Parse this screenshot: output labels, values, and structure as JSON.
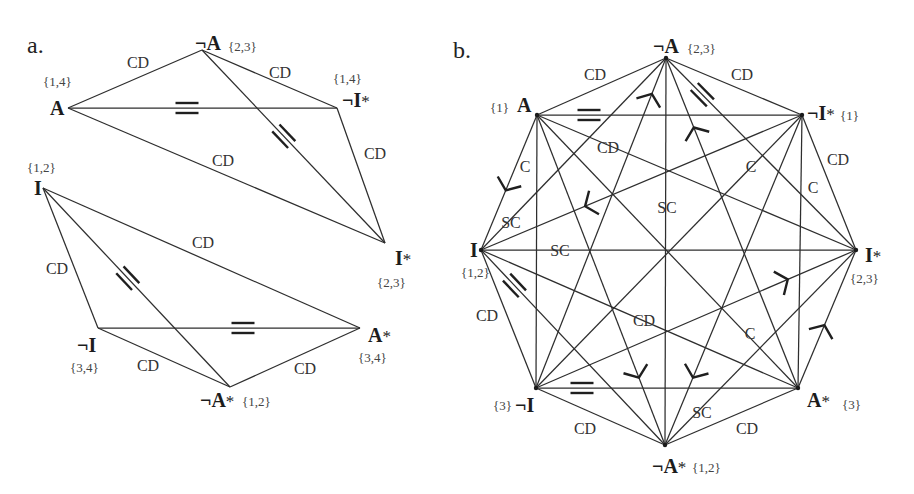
{
  "figure": {
    "colors": {
      "line": "#2e2e2e",
      "text": "#333333",
      "background": "#ffffff"
    },
    "panels": [
      {
        "key": "a",
        "label": "a.",
        "label_xy": [
          27,
          53
        ],
        "vertex_dots": false,
        "vertices": [
          {
            "id": "A",
            "label": "A",
            "star": "",
            "set": "{1,4}",
            "xy": [
              68,
              108
            ],
            "label_xy": [
              50,
              115
            ],
            "set_xy": [
              43,
              86
            ]
          },
          {
            "id": "notA",
            "label": "¬A",
            "star": "",
            "set": "{2,3}",
            "xy": [
              202,
              50
            ],
            "label_xy": [
              195,
              50
            ],
            "set_xy": [
              228,
              51
            ]
          },
          {
            "id": "notIstar",
            "label": "¬I",
            "star": "*",
            "set": "{1,4}",
            "xy": [
              337,
              108
            ],
            "label_xy": [
              342,
              107
            ],
            "set_xy": [
              333,
              83
            ]
          },
          {
            "id": "Istar",
            "label": "I",
            "star": "*",
            "set": "{2,3}",
            "xy": [
              385,
              243
            ],
            "label_xy": [
              395,
              265
            ],
            "set_xy": [
              377,
              287
            ]
          },
          {
            "id": "I",
            "label": "I",
            "star": "",
            "set": "{1,2}",
            "xy": [
              43,
              188
            ],
            "label_xy": [
              34,
              195
            ],
            "set_xy": [
              27,
              172
            ]
          },
          {
            "id": "notI",
            "label": "¬I",
            "star": "",
            "set": "{3,4}",
            "xy": [
              98,
              328
            ],
            "label_xy": [
              77,
              352
            ],
            "set_xy": [
              70,
              372
            ]
          },
          {
            "id": "notAstar",
            "label": "¬A",
            "star": "*",
            "set": "{1,2}",
            "xy": [
              230,
              387
            ],
            "label_xy": [
              200,
              407
            ],
            "set_xy": [
              242,
              406
            ]
          },
          {
            "id": "Astar",
            "label": "A",
            "star": "*",
            "set": "{3,4}",
            "xy": [
              360,
              328
            ],
            "label_xy": [
              368,
              342
            ],
            "set_xy": [
              358,
              362
            ]
          }
        ],
        "edges": [
          {
            "from": "A",
            "to": "notA",
            "marks": [
              {
                "type": "text",
                "text": "CD",
                "xy": [
                  138,
                  62
                ]
              }
            ]
          },
          {
            "from": "notA",
            "to": "notIstar",
            "marks": [
              {
                "type": "text",
                "text": "CD",
                "xy": [
                  280,
                  72
                ]
              }
            ]
          },
          {
            "from": "A",
            "to": "notIstar",
            "marks": [
              {
                "type": "equal",
                "xy": [
                  187,
                  107
                ]
              }
            ]
          },
          {
            "from": "notA",
            "to": "Istar",
            "marks": [
              {
                "type": "equal",
                "xy": [
                  283,
                  137
                ]
              }
            ]
          },
          {
            "from": "A",
            "to": "Istar",
            "marks": [
              {
                "type": "text",
                "text": "CD",
                "xy": [
                  223,
                  160
                ]
              }
            ]
          },
          {
            "from": "notIstar",
            "to": "Istar",
            "marks": [
              {
                "type": "text",
                "text": "CD",
                "xy": [
                  375,
                  153
                ]
              }
            ]
          },
          {
            "from": "I",
            "to": "notI",
            "marks": [
              {
                "type": "text",
                "text": "CD",
                "xy": [
                  57,
                  268
                ]
              }
            ]
          },
          {
            "from": "I",
            "to": "notAstar",
            "marks": [
              {
                "type": "equal",
                "xy": [
                  128,
                  278
                ]
              }
            ]
          },
          {
            "from": "I",
            "to": "Astar",
            "marks": [
              {
                "type": "text",
                "text": "CD",
                "xy": [
                  203,
                  242
                ]
              }
            ]
          },
          {
            "from": "notI",
            "to": "Astar",
            "marks": [
              {
                "type": "equal",
                "xy": [
                  243,
                  328
                ]
              }
            ]
          },
          {
            "from": "notI",
            "to": "notAstar",
            "marks": [
              {
                "type": "text",
                "text": "CD",
                "xy": [
                  148,
                  365
                ]
              }
            ]
          },
          {
            "from": "notAstar",
            "to": "Astar",
            "marks": [
              {
                "type": "text",
                "text": "CD",
                "xy": [
                  305,
                  368
                ]
              }
            ]
          }
        ]
      },
      {
        "key": "b",
        "label": "b.",
        "label_xy": [
          453,
          58
        ],
        "vertex_dots": true,
        "vertices": [
          {
            "id": "notA",
            "label": "¬A",
            "star": "",
            "set": "{2,3}",
            "xy": [
              666,
              58
            ],
            "label_xy": [
              653,
              53
            ],
            "set_xy": [
              687,
              53
            ]
          },
          {
            "id": "notIstar",
            "label": "¬I",
            "star": "*",
            "set": "{1}",
            "xy": [
              802,
              115
            ],
            "label_xy": [
              807,
              120
            ],
            "set_xy": [
              840,
              120
            ]
          },
          {
            "id": "Istar",
            "label": "I",
            "star": "*",
            "set": "{2,3}",
            "xy": [
              856,
              250
            ],
            "label_xy": [
              865,
              262
            ],
            "set_xy": [
              850,
              283
            ]
          },
          {
            "id": "Astar",
            "label": "A",
            "star": "*",
            "set": "{3}",
            "xy": [
              798,
              388
            ],
            "label_xy": [
              807,
              407
            ],
            "set_xy": [
              842,
              409
            ]
          },
          {
            "id": "notAstar",
            "label": "¬A",
            "star": "*",
            "set": "{1,2}",
            "xy": [
              665,
              445
            ],
            "label_xy": [
              652,
              473
            ],
            "set_xy": [
              692,
              472
            ]
          },
          {
            "id": "notI",
            "label": "¬I",
            "star": "",
            "set": "{3}",
            "xy": [
              536,
              388
            ],
            "label_xy": [
              515,
              412
            ],
            "set_xy": [
              493,
              410
            ]
          },
          {
            "id": "I",
            "label": "I",
            "star": "",
            "set": "{1,2}",
            "xy": [
              481,
              250
            ],
            "label_xy": [
              470,
              257
            ],
            "set_xy": [
              461,
              277
            ]
          },
          {
            "id": "A",
            "label": "A",
            "star": "",
            "set": "{1}",
            "xy": [
              537,
              115
            ],
            "label_xy": [
              517,
              112
            ],
            "set_xy": [
              490,
              112
            ]
          }
        ],
        "edges": [
          {
            "from": "notA",
            "to": "notIstar",
            "marks": [
              {
                "type": "text",
                "text": "CD",
                "xy": [
                  742,
                  74
                ]
              }
            ]
          },
          {
            "from": "notA",
            "to": "Istar",
            "marks": [
              {
                "type": "equal",
                "xy": [
                  703,
                  94
                ]
              }
            ]
          },
          {
            "from": "notA",
            "to": "Astar",
            "marks": [
              {
                "type": "arrow",
                "toward": "notA",
                "xy": [
                  695,
                  127
                ]
              }
            ]
          },
          {
            "from": "notA",
            "to": "notAstar",
            "marks": [
              {
                "type": "text",
                "text": "SC",
                "xy": [
                  667,
                  207
                ]
              }
            ]
          },
          {
            "from": "notA",
            "to": "notI",
            "marks": [
              {
                "type": "arrow",
                "toward": "notA",
                "xy": [
                  652,
                  94
                ]
              }
            ]
          },
          {
            "from": "notA",
            "to": "I",
            "marks": [
              {
                "type": "text",
                "text": "SC",
                "xy": [
                  511,
                  222
                ]
              }
            ]
          },
          {
            "from": "notA",
            "to": "A",
            "marks": [
              {
                "type": "text",
                "text": "CD",
                "xy": [
                  595,
                  74
                ]
              }
            ]
          },
          {
            "from": "notIstar",
            "to": "Istar",
            "marks": [
              {
                "type": "text",
                "text": "CD",
                "xy": [
                  838,
                  159
                ]
              }
            ]
          },
          {
            "from": "notIstar",
            "to": "Astar",
            "marks": [
              {
                "type": "text",
                "text": "C",
                "xy": [
                  813,
                  187
                ]
              }
            ]
          },
          {
            "from": "notIstar",
            "to": "notAstar",
            "marks": [
              {
                "type": "arrow",
                "toward": "notAstar",
                "xy": [
                  694,
                  378
                ]
              }
            ]
          },
          {
            "from": "notIstar",
            "to": "notI",
            "marks": [
              {
                "type": "text",
                "text": "C",
                "xy": [
                  751,
                  166
                ]
              }
            ]
          },
          {
            "from": "notIstar",
            "to": "I",
            "marks": [
              {
                "type": "arrow",
                "toward": "I",
                "xy": [
                  585,
                  206
                ]
              }
            ]
          },
          {
            "from": "notIstar",
            "to": "A",
            "marks": [
              {
                "type": "equal",
                "xy": [
                  589,
                  115
                ]
              }
            ]
          },
          {
            "from": "Istar",
            "to": "Astar",
            "marks": [
              {
                "type": "arrow",
                "toward": "Istar",
                "xy": [
                  824,
                  325
                ]
              }
            ]
          },
          {
            "from": "Istar",
            "to": "notAstar",
            "marks": [
              {
                "type": "text",
                "text": "SC",
                "xy": [
                  702,
                  412
                ]
              }
            ]
          },
          {
            "from": "Istar",
            "to": "notI",
            "marks": [
              {
                "type": "arrow",
                "toward": "Istar",
                "xy": [
                  788,
                  280
                ]
              }
            ]
          },
          {
            "from": "Istar",
            "to": "I",
            "marks": [
              {
                "type": "text",
                "text": "SC",
                "xy": [
                  560,
                  250
                ]
              }
            ]
          },
          {
            "from": "Istar",
            "to": "A",
            "marks": [
              {
                "type": "text",
                "text": "CD",
                "xy": [
                  608,
                  147
                ]
              }
            ]
          },
          {
            "from": "Astar",
            "to": "notAstar",
            "marks": [
              {
                "type": "text",
                "text": "CD",
                "xy": [
                  747,
                  428
                ]
              }
            ]
          },
          {
            "from": "Astar",
            "to": "notI",
            "marks": [
              {
                "type": "equal",
                "xy": [
                  582,
                  388
                ]
              }
            ]
          },
          {
            "from": "Astar",
            "to": "I",
            "marks": [
              {
                "type": "text",
                "text": "CD",
                "xy": [
                  644,
                  320
                ]
              }
            ]
          },
          {
            "from": "Astar",
            "to": "A",
            "marks": [
              {
                "type": "text",
                "text": "C",
                "xy": [
                  750,
                  333
                ]
              }
            ]
          },
          {
            "from": "notAstar",
            "to": "notI",
            "marks": [
              {
                "type": "text",
                "text": "CD",
                "xy": [
                  585,
                  428
                ]
              }
            ]
          },
          {
            "from": "notAstar",
            "to": "I",
            "marks": [
              {
                "type": "equal",
                "xy": [
                  515,
                  285
                ]
              }
            ]
          },
          {
            "from": "notAstar",
            "to": "A",
            "marks": [
              {
                "type": "arrow",
                "toward": "notAstar",
                "xy": [
                  638,
                  378
                ]
              }
            ]
          },
          {
            "from": "notI",
            "to": "I",
            "marks": [
              {
                "type": "text",
                "text": "CD",
                "xy": [
                  487,
                  315
                ]
              }
            ]
          },
          {
            "from": "notI",
            "to": "A",
            "marks": []
          },
          {
            "from": "I",
            "to": "A",
            "marks": [
              {
                "type": "text",
                "text": "C",
                "xy": [
                  525,
                  166
                ]
              },
              {
                "type": "arrow",
                "toward": "I",
                "xy": [
                  505,
                  190
                ]
              }
            ]
          }
        ]
      }
    ]
  }
}
